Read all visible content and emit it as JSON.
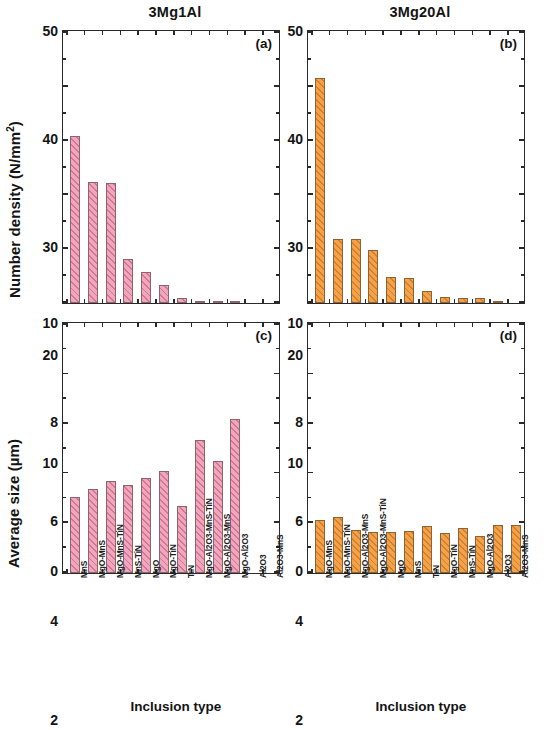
{
  "figure": {
    "column_titles": {
      "left": "3Mg1Al",
      "right": "3Mg20Al"
    },
    "axis_titles": {
      "y_top": "Number density (N/mm",
      "y_top_sup": "2",
      "y_top_close": ")",
      "y_bottom": "Average size (µm)",
      "x": "Inclusion type"
    },
    "panel_letters": {
      "a": "(a)",
      "b": "(b)",
      "c": "(c)",
      "d": "(d)"
    },
    "colors": {
      "pink_fill": "#eea7bd",
      "pink_hatch": "#d66a8c",
      "orange_fill": "#f3a24a",
      "orange_hatch": "#cd7620",
      "axis": "#2a2a2a",
      "text": "#141414"
    }
  },
  "chart_data": [
    {
      "id": "a",
      "type": "bar",
      "title": "3Mg1Al",
      "panel_label": "(a)",
      "xlabel": "Inclusion type",
      "ylabel": "Number density (N/mm2)",
      "ylim": [
        0,
        50
      ],
      "yticks": [
        0,
        10,
        20,
        30,
        40,
        50
      ],
      "ytick_labels": [
        "0",
        "10",
        "20",
        "30",
        "40",
        "50"
      ],
      "grid": false,
      "legend": "none",
      "color": "#eea7bd",
      "categories": [
        "MnS",
        "MgO-MnS",
        "MgO-MnS-TiN",
        "MnS-TiN",
        "MgO",
        "MgO-TiN",
        "TiN",
        "MgO-Al2O3-MnS-TiN",
        "MgO-Al2O3-MnS",
        "MgO-Al2O3",
        "Al2O3",
        "Al2O3-MnS"
      ],
      "values": [
        30.9,
        22.4,
        22.2,
        8.2,
        5.7,
        3.3,
        0.9,
        0.45,
        0.15,
        0.1,
        0,
        0
      ]
    },
    {
      "id": "b",
      "type": "bar",
      "title": "3Mg20Al",
      "panel_label": "(b)",
      "xlabel": "Inclusion type",
      "ylabel": "Number density (N/mm2)",
      "ylim": [
        0,
        50
      ],
      "yticks": [
        0,
        10,
        20,
        30,
        40,
        50
      ],
      "ytick_labels": [
        "0",
        "10",
        "20",
        "30",
        "40",
        "50"
      ],
      "grid": false,
      "legend": "none",
      "color": "#f3a24a",
      "categories": [
        "MgO-MnS",
        "MgO-MnS-TiN",
        "MgO-Al2O3-MnS",
        "MgO-Al2O3-MnS-TiN",
        "MgO",
        "MnS",
        "TiN",
        "MgO-TiN",
        "MnS-TiN",
        "MgO-Al2O3",
        "Al2O3",
        "Al2O3-MnS"
      ],
      "values": [
        41.6,
        11.9,
        11.8,
        9.9,
        4.9,
        4.6,
        2.3,
        1.1,
        1.0,
        0.9,
        0.15,
        0
      ]
    },
    {
      "id": "c",
      "type": "bar",
      "title": "3Mg1Al",
      "panel_label": "(c)",
      "xlabel": "Inclusion type",
      "ylabel": "Average size (µm)",
      "ylim": [
        0,
        10
      ],
      "yticks": [
        0,
        2,
        4,
        6,
        8,
        10
      ],
      "ytick_labels": [
        "0",
        "2",
        "4",
        "6",
        "8",
        "10"
      ],
      "grid": false,
      "legend": "none",
      "color": "#eea7bd",
      "categories": [
        "MnS",
        "MgO-MnS",
        "MgO-MnS-TiN",
        "MnS-TiN",
        "MgO",
        "MgO-TiN",
        "TiN",
        "MgO-Al2O3-MnS-TiN",
        "MgO-Al2O3-MnS",
        "MgO-Al2O3",
        "Al2O3",
        "Al2O3-MnS"
      ],
      "values": [
        3.05,
        3.4,
        3.7,
        3.55,
        3.85,
        4.1,
        2.7,
        5.35,
        4.5,
        6.2,
        0,
        0
      ]
    },
    {
      "id": "d",
      "type": "bar",
      "title": "3Mg20Al",
      "panel_label": "(d)",
      "xlabel": "Inclusion type",
      "ylabel": "Average size (µm)",
      "ylim": [
        0,
        10
      ],
      "yticks": [
        0,
        2,
        4,
        6,
        8,
        10
      ],
      "ytick_labels": [
        "0",
        "2",
        "4",
        "6",
        "8",
        "10"
      ],
      "grid": false,
      "legend": "none",
      "color": "#f3a24a",
      "categories": [
        "MgO-MnS",
        "MgO-MnS-TiN",
        "MgO-Al2O3-MnS",
        "MgO-Al2O3-MnS-TiN",
        "MgO",
        "MnS",
        "TiN",
        "MgO-TiN",
        "MnS-TiN",
        "MgO-Al2O3",
        "Al2O3",
        "Al2O3-MnS"
      ],
      "values": [
        2.15,
        2.25,
        1.75,
        1.65,
        1.65,
        1.7,
        1.9,
        1.6,
        1.8,
        1.5,
        1.95,
        1.95
      ]
    }
  ]
}
